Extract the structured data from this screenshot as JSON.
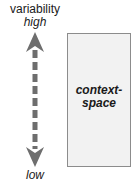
{
  "axis": {
    "title": "variability",
    "top_label": "high",
    "bottom_label": "low",
    "arrow_color": "#6e6e6e"
  },
  "box": {
    "line1": "context-",
    "line2": "space",
    "fill": "#f2f2f2",
    "border": "#8c8c8c"
  }
}
